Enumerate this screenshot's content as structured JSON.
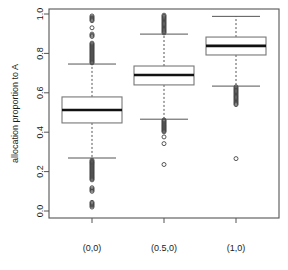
{
  "chart_data": {
    "type": "box",
    "title": "",
    "xlabel": "",
    "ylabel": "allocation proportion to A",
    "ylim": [
      0.0,
      1.0
    ],
    "yticks": [
      0.0,
      0.2,
      0.4,
      0.6,
      0.8,
      1.0
    ],
    "ytick_labels": [
      "0.0",
      "0.2",
      "0.4",
      "0.6",
      "0.8",
      "1.0"
    ],
    "categories": [
      "(0,0)",
      "(0.5,0)",
      "(1,0)"
    ],
    "grid": false,
    "legend": null,
    "boxes": [
      {
        "category": "(0,0)",
        "q1": 0.447,
        "median": 0.513,
        "q3": 0.579,
        "whisker_low": 0.269,
        "whisker_high": 0.746,
        "outliers_low": [
          0.258,
          0.252,
          0.247,
          0.243,
          0.238,
          0.233,
          0.228,
          0.223,
          0.218,
          0.213,
          0.208,
          0.203,
          0.198,
          0.193,
          0.188,
          0.183,
          0.178,
          0.173,
          0.168,
          0.163,
          0.158,
          0.118,
          0.112,
          0.106,
          0.1,
          0.044,
          0.038,
          0.032,
          0.026,
          0.02
        ],
        "outliers_high": [
          0.752,
          0.757,
          0.762,
          0.767,
          0.772,
          0.777,
          0.782,
          0.787,
          0.792,
          0.797,
          0.802,
          0.807,
          0.812,
          0.817,
          0.822,
          0.827,
          0.832,
          0.837,
          0.842,
          0.847,
          0.852,
          0.886,
          0.892,
          0.898,
          0.93,
          0.966,
          0.972,
          0.978,
          0.984,
          0.99
        ]
      },
      {
        "category": "(0.5,0)",
        "q1": 0.64,
        "median": 0.69,
        "q3": 0.736,
        "whisker_low": 0.466,
        "whisker_high": 0.898,
        "outliers_low": [
          0.462,
          0.457,
          0.452,
          0.447,
          0.442,
          0.437,
          0.432,
          0.427,
          0.422,
          0.417,
          0.412,
          0.407,
          0.402,
          0.376,
          0.342,
          0.236
        ],
        "outliers_high": [
          0.904,
          0.91,
          0.916,
          0.922,
          0.928,
          0.934,
          0.94,
          0.946,
          0.952,
          0.958,
          0.964,
          0.97,
          0.976,
          0.982,
          0.988,
          0.994
        ]
      },
      {
        "category": "(1,0)",
        "q1": 0.792,
        "median": 0.838,
        "q3": 0.883,
        "whisker_low": 0.634,
        "whisker_high": 0.988,
        "outliers_low": [
          0.63,
          0.624,
          0.618,
          0.612,
          0.606,
          0.6,
          0.594,
          0.588,
          0.582,
          0.576,
          0.57,
          0.564,
          0.558,
          0.552,
          0.546,
          0.54,
          0.266
        ],
        "outliers_high": []
      }
    ]
  }
}
